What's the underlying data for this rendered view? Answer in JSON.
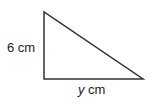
{
  "diagram": {
    "shape": "right-triangle",
    "stroke_color": "#333333",
    "vertices": {
      "top": [
        44,
        12
      ],
      "right_angle": [
        44,
        79
      ],
      "right": [
        143,
        79
      ]
    },
    "labels": {
      "vertical_side": "6 cm",
      "horizontal_side_var": "y",
      "horizontal_side_unit": " cm"
    }
  }
}
